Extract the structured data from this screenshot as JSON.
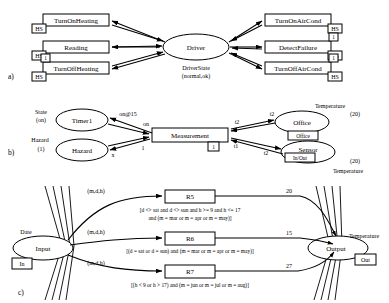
{
  "sections": {
    "a": {
      "label": "a)"
    },
    "b": {
      "label": "b)"
    },
    "c": {
      "label": "c)"
    }
  },
  "panel_a": {
    "center_node": "Driver",
    "center_state_label": "DriverState",
    "center_state_value": "(normal,ok)",
    "left_nodes": [
      {
        "name": "TurnOnHeating",
        "tag": "HS"
      },
      {
        "name": "Reading",
        "tag": "HS"
      },
      {
        "name": "TurnOffHeating",
        "tag": "HS",
        "tag2": "1"
      }
    ],
    "right_nodes": [
      {
        "name": "TurnOnAirCond",
        "tag": "HS"
      },
      {
        "name": "DetectFailure",
        "tag": "HS",
        "tag2": "1"
      },
      {
        "name": "TurnOffAirCond",
        "tag": "HS",
        "tag2": "1"
      }
    ]
  },
  "panel_b": {
    "nodes": {
      "timer": "Timer1",
      "hazard": "Hazard",
      "measurement": "Measurement",
      "office": "Office",
      "sensor": "Sensor"
    },
    "annotations": {
      "state_label": "State",
      "state_value": "(on)",
      "hazard_label": "Hazard",
      "hazard_value": "(1)",
      "office_temp_label": "Temperature",
      "office_temp_value": "(20)",
      "sensor_temp_label": "Temperature",
      "sensor_temp_value": "(20)",
      "office_tag": "Office",
      "sensor_tag": "In/Out",
      "measurement_tag": "1"
    },
    "edge_labels": {
      "timer_to_meas": "on@15",
      "meas_in_on": "on",
      "hazard_out": "x",
      "hazard_in": "1",
      "office_out": "t2",
      "office_in": "t2",
      "sensor_in": "t2",
      "sensor_out": "t1"
    }
  },
  "panel_c": {
    "input_node": "Input",
    "input_label": "Date",
    "input_tag": "In",
    "output_node": "Output",
    "output_label": "Temperature",
    "output_tag": "Out",
    "rules": [
      {
        "name": "R5",
        "in_label": "(m,d,h)",
        "weight": "20",
        "condition_line1": "[d <> sat and d <> sun and h >= 9 and h <= 17",
        "condition_line2": "and (m = mar or m = apr or m = may)]"
      },
      {
        "name": "R6",
        "in_label": "(m,d,h)",
        "weight": "15",
        "condition_line1": "[(d = sat or d = sun)  and (m = mar or m = apr or m = may)]",
        "condition_line2": ""
      },
      {
        "name": "R7",
        "in_label": "(m,d,h)",
        "weight": "27",
        "condition_line1": "[(h < 9 or h > 17)  and (m = jun or m = jul or m = aug)]",
        "condition_line2": ""
      }
    ]
  }
}
